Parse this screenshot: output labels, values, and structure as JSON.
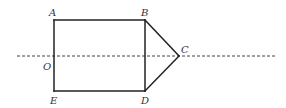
{
  "diagram": {
    "type": "geometry-figure",
    "points": [
      {
        "id": "A",
        "label": "A",
        "x": 54,
        "y": 20,
        "label_x": 49,
        "label_y": 16
      },
      {
        "id": "B",
        "label": "B",
        "x": 145,
        "y": 20,
        "label_x": 141,
        "label_y": 16
      },
      {
        "id": "C",
        "label": "C",
        "x": 179,
        "y": 56,
        "label_x": 181,
        "label_y": 53
      },
      {
        "id": "D",
        "label": "D",
        "x": 145,
        "y": 91,
        "label_x": 141,
        "label_y": 104
      },
      {
        "id": "E",
        "label": "E",
        "x": 54,
        "y": 91,
        "label_x": 50,
        "label_y": 104
      },
      {
        "id": "O",
        "label": "O",
        "x": 54,
        "y": 56,
        "label_x": 43,
        "label_y": 70
      }
    ],
    "segments": [
      {
        "from": "A",
        "to": "B",
        "style": "solid"
      },
      {
        "from": "B",
        "to": "D",
        "style": "solid"
      },
      {
        "from": "D",
        "to": "E",
        "style": "solid"
      },
      {
        "from": "E",
        "to": "A",
        "style": "solid"
      },
      {
        "from": "B",
        "to": "C",
        "style": "solid"
      },
      {
        "from": "C",
        "to": "D",
        "style": "solid"
      }
    ],
    "axis": {
      "style": "dashed",
      "x1": 17,
      "y1": 56,
      "x2": 277,
      "y2": 56,
      "passes_through": [
        "O",
        "C"
      ]
    },
    "colors": {
      "line": "#222222",
      "dash": "#444444",
      "label": "#333333",
      "background": "#ffffff"
    }
  }
}
